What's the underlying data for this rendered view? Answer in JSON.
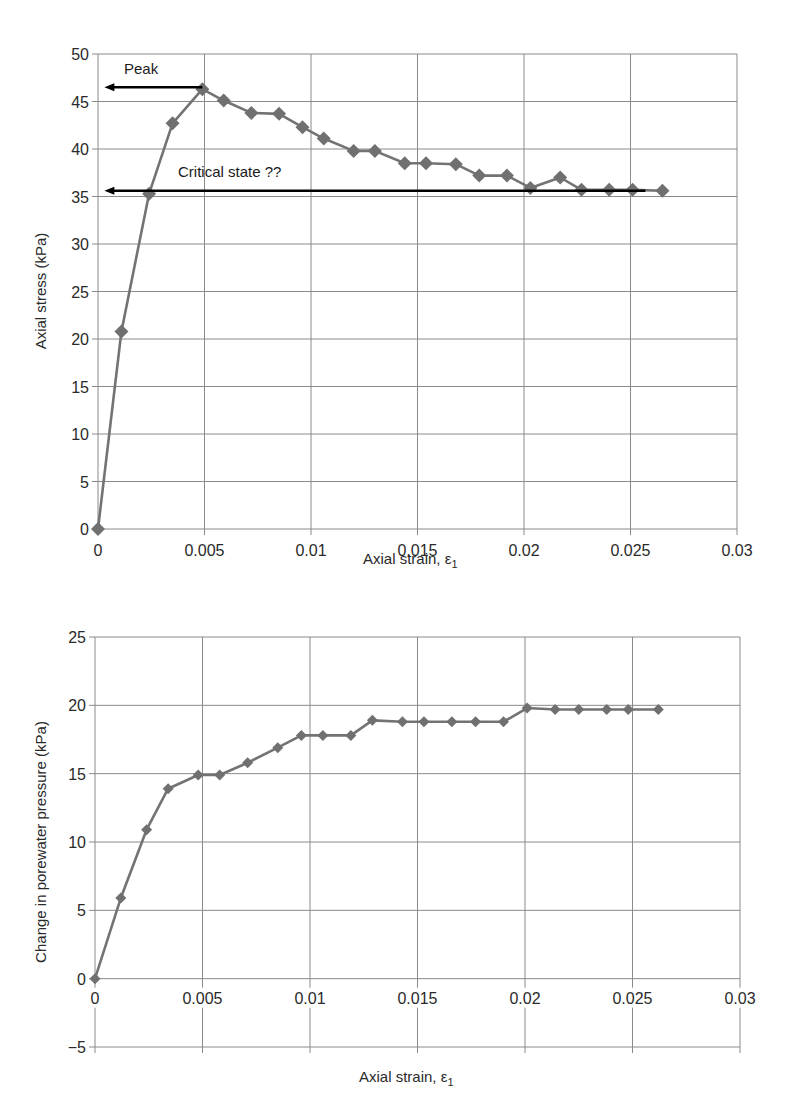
{
  "chart_data": [
    {
      "type": "line",
      "title": "",
      "xlabel": "Axial strain, ε1",
      "ylabel": "Axial stress (kPa)",
      "xlim": [
        0,
        0.03
      ],
      "ylim": [
        0,
        50
      ],
      "x_ticks": [
        "0",
        "0.005",
        "0.01",
        "0.015",
        "0.02",
        "0.025",
        "0.03"
      ],
      "y_ticks": [
        "0",
        "5",
        "10",
        "15",
        "20",
        "25",
        "30",
        "35",
        "40",
        "45",
        "50"
      ],
      "grid": true,
      "legend": null,
      "marker": "diamond",
      "series": [
        {
          "name": "Axial stress",
          "x": [
            0,
            0.0011,
            0.0024,
            0.0035,
            0.0049,
            0.0059,
            0.0072,
            0.0085,
            0.0096,
            0.0106,
            0.012,
            0.013,
            0.0144,
            0.0154,
            0.0168,
            0.0179,
            0.0192,
            0.0203,
            0.0217,
            0.0227,
            0.024,
            0.0251,
            0.0265
          ],
          "values": [
            0,
            20.8,
            35.3,
            42.7,
            46.3,
            45.1,
            43.8,
            43.7,
            42.3,
            41.1,
            39.8,
            39.8,
            38.5,
            38.5,
            38.4,
            37.2,
            37.2,
            35.9,
            37.0,
            35.7,
            35.7,
            35.7,
            35.6
          ]
        }
      ],
      "annotations": [
        {
          "text": "Peak",
          "value": 46.5,
          "arrow_from_x": 0.0049,
          "arrow_to_x": 0.0003
        },
        {
          "text": "Critical state ??",
          "value": 35.6,
          "arrow_from_x": 0.0257,
          "arrow_to_x": 0.0003
        }
      ]
    },
    {
      "type": "line",
      "title": "",
      "xlabel": "Axial strain, ε1",
      "ylabel": "Change in porewater pressure (kPa)",
      "xlim": [
        0,
        0.03
      ],
      "ylim": [
        -5,
        25
      ],
      "x_ticks": [
        "0",
        "0.005",
        "0.01",
        "0.015",
        "0.02",
        "0.025",
        "0.03"
      ],
      "y_ticks": [
        "−5",
        "0",
        "5",
        "10",
        "15",
        "20",
        "25"
      ],
      "grid": true,
      "legend": null,
      "marker": "diamond",
      "series": [
        {
          "name": "Change in porewater pressure",
          "x": [
            0,
            0.0012,
            0.0024,
            0.0034,
            0.0048,
            0.0058,
            0.0071,
            0.0085,
            0.0096,
            0.0106,
            0.0119,
            0.0129,
            0.0143,
            0.0153,
            0.0166,
            0.0177,
            0.019,
            0.0201,
            0.0214,
            0.0225,
            0.0238,
            0.0248,
            0.0262
          ],
          "values": [
            0,
            5.9,
            10.9,
            13.9,
            14.9,
            14.9,
            15.8,
            16.9,
            17.8,
            17.8,
            17.8,
            18.9,
            18.8,
            18.8,
            18.8,
            18.8,
            18.8,
            19.8,
            19.7,
            19.7,
            19.7,
            19.7,
            19.7
          ]
        }
      ]
    }
  ],
  "charts": {
    "top": {
      "xlabel": "Axial strain, ε",
      "xlabel_sub": "1",
      "ylabel": "Axial stress (kPa)",
      "peak_label": "Peak",
      "critical_label": "Critical state ??"
    },
    "bottom": {
      "xlabel": "Axial strain, ε",
      "xlabel_sub": "1",
      "ylabel": "Change in porewater pressure (kPa)"
    }
  },
  "colors": {
    "series": "#737373",
    "marker": "#707070",
    "grid": "#8a8a8a",
    "arrow": "#000000"
  }
}
